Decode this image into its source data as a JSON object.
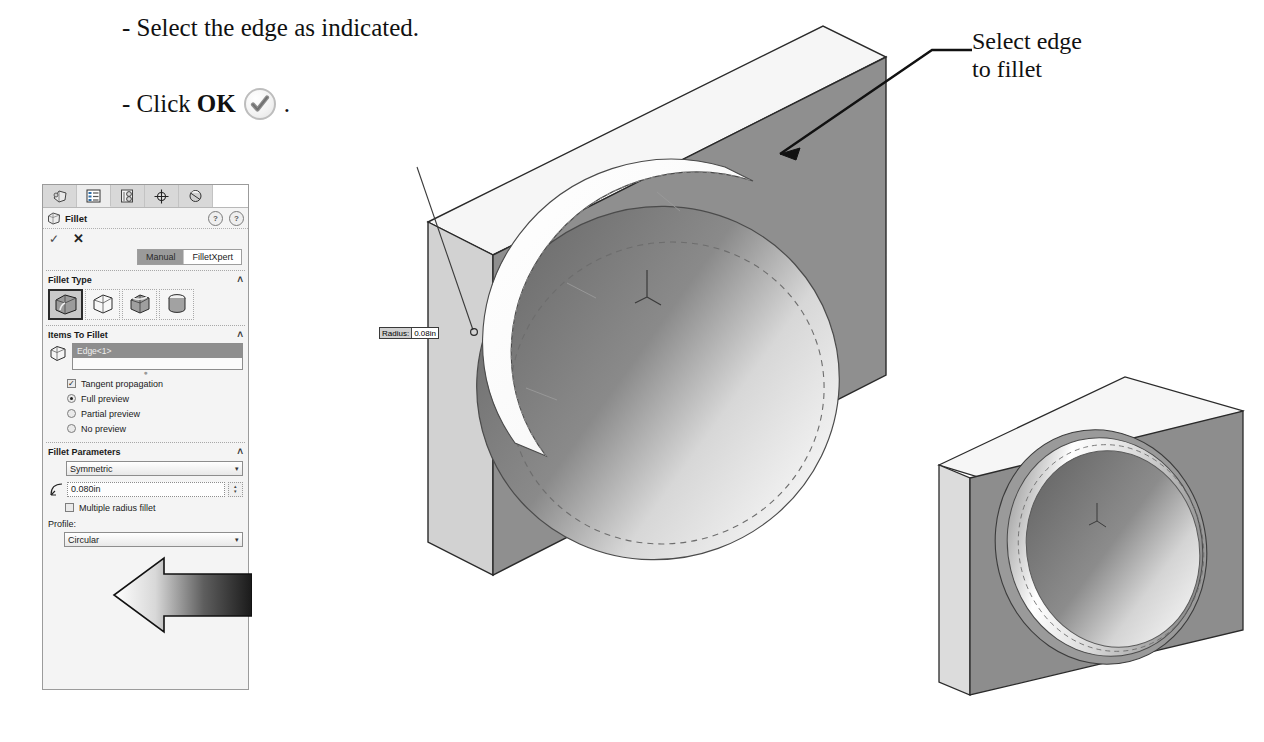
{
  "instructions": {
    "line1": "- Select the edge as indicated.",
    "line2_prefix": "- Click ",
    "line2_bold": "OK",
    "line2_suffix": ".",
    "ok_icon": "checkmark-circle-icon"
  },
  "annotations": {
    "edge_note_line1": "Select edge",
    "edge_note_line2": "to fillet",
    "radius_callout_label": "Radius:",
    "radius_callout_value": "0.08in"
  },
  "property_manager": {
    "tabs": [
      {
        "name": "feature-manager-tab",
        "icon": "feature-tree-icon",
        "active": false
      },
      {
        "name": "property-manager-tab",
        "icon": "property-list-icon",
        "active": true
      },
      {
        "name": "configuration-manager-tab",
        "icon": "configuration-icon",
        "active": false
      },
      {
        "name": "dimxpert-manager-tab",
        "icon": "dimxpert-target-icon",
        "active": false
      },
      {
        "name": "display-manager-tab",
        "icon": "display-sphere-icon",
        "active": false
      }
    ],
    "title": "Fillet",
    "title_icon": "fillet-feature-icon",
    "help_icons": [
      "help-question-pin-icon",
      "help-question-icon"
    ],
    "ok_label": "✓",
    "cancel_label": "✕",
    "mode_buttons": [
      {
        "label": "Manual",
        "selected": true
      },
      {
        "label": "FilletXpert",
        "selected": false
      }
    ],
    "sections": {
      "fillet_type": {
        "header": "Fillet Type",
        "chevron": "˄",
        "buttons": [
          {
            "name": "constant-size-fillet-icon",
            "selected": true
          },
          {
            "name": "variable-size-fillet-icon",
            "selected": false
          },
          {
            "name": "face-fillet-icon",
            "selected": false
          },
          {
            "name": "full-round-fillet-icon",
            "selected": false
          }
        ]
      },
      "items_to_fillet": {
        "header": "Items To Fillet",
        "chevron": "˄",
        "selection_icon": "edge-selection-icon",
        "selected_items": [
          "Edge<1>"
        ],
        "options": [
          {
            "type": "checkbox",
            "label": "Tangent propagation",
            "checked": true
          },
          {
            "type": "radio",
            "label": "Full preview",
            "checked": true
          },
          {
            "type": "radio",
            "label": "Partial preview",
            "checked": false
          },
          {
            "type": "radio",
            "label": "No preview",
            "checked": false
          }
        ]
      },
      "fillet_parameters": {
        "header": "Fillet Parameters",
        "chevron": "˄",
        "symmetry_value": "Symmetric",
        "radius_icon": "radius-dimension-icon",
        "radius_value": "0.080in",
        "multiple_radius_label": "Multiple radius fillet",
        "multiple_radius_checked": false,
        "profile_label": "Profile:",
        "profile_value": "Circular",
        "dropdown_arrow": "▾",
        "spinner_up": "▴",
        "spinner_down": "▾"
      }
    }
  },
  "models": {
    "left": {
      "name": "block-with-spherical-cavity-preview",
      "description": "Isometric rectangular plate with large spherical dished cavity and highlighted fillet band on the cavity rim"
    },
    "right": {
      "name": "block-with-filleted-cavity-result",
      "description": "Isometric rectangular plate with finished filleted spherical cavity"
    }
  },
  "colors": {
    "panel_bg": "#f4f4f4",
    "panel_border": "#9b9b9b",
    "selection_highlight": "#8e8e8e",
    "model_face_front": "#8f8f8f",
    "model_face_top": "#f2f2f2",
    "model_face_side": "#c9c9c9",
    "ink": "#111111"
  }
}
